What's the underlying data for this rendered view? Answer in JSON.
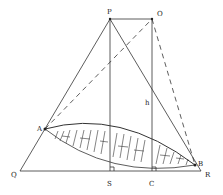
{
  "diagram": {
    "points": {
      "P": {
        "label": "P"
      },
      "O": {
        "label": "O"
      },
      "A": {
        "label": "A"
      },
      "B": {
        "label": "B"
      },
      "Q": {
        "label": "Q"
      },
      "S": {
        "label": "S"
      },
      "C": {
        "label": "C"
      },
      "R": {
        "label": "R"
      }
    },
    "height_label": "h",
    "colors": {
      "line": "#333333",
      "background": "#ffffff"
    }
  }
}
